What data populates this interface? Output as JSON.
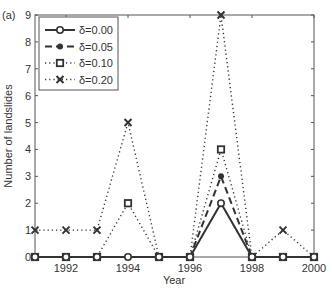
{
  "panel_label": "(a)",
  "chart_data": {
    "type": "line",
    "title": "",
    "xlabel": "Year",
    "ylabel": "Number of landslides",
    "x": [
      1991,
      1992,
      1993,
      1994,
      1995,
      1996,
      1997,
      1998,
      1999,
      2000
    ],
    "xlim": [
      1991,
      2000
    ],
    "ylim": [
      0,
      9
    ],
    "xticks": [
      1992,
      1994,
      1996,
      1998,
      2000
    ],
    "yticks": [
      0,
      1,
      2,
      3,
      4,
      5,
      6,
      7,
      8,
      9
    ],
    "grid": false,
    "legend_position": "upper left",
    "series": [
      {
        "name": "δ=0.00",
        "style": "solid",
        "marker": "circle",
        "values": [
          0,
          0,
          0,
          0,
          0,
          0,
          2,
          0,
          0,
          0
        ]
      },
      {
        "name": "δ=0.05",
        "style": "dashed",
        "marker": "dot",
        "values": [
          0,
          0,
          0,
          0,
          0,
          0,
          3,
          0,
          0,
          0
        ]
      },
      {
        "name": "δ=0.10",
        "style": "dotted",
        "marker": "square",
        "values": [
          0,
          0,
          0,
          2,
          0,
          0,
          4,
          0,
          0,
          0
        ]
      },
      {
        "name": "δ=0.20",
        "style": "dotted",
        "marker": "x",
        "values": [
          1,
          1,
          1,
          5,
          0,
          0,
          9,
          0,
          1,
          0
        ]
      }
    ]
  },
  "colors": {
    "line": "#333333",
    "axis": "#555555",
    "background": "#ffffff"
  }
}
